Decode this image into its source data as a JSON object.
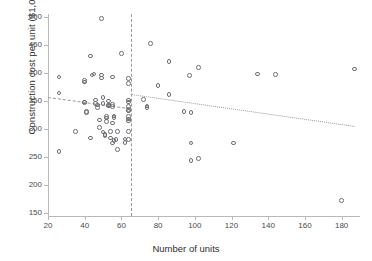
{
  "figure": {
    "title_fragment": "",
    "xlabel": "Number of units",
    "ylabel": "Construction cost per unit ($1,000s)"
  },
  "chart_data": {
    "type": "scatter",
    "title": "",
    "xlabel": "Number of units",
    "ylabel": "Construction cost per unit ($1,000s)",
    "xlim": [
      20,
      190
    ],
    "ylim": [
      145,
      505
    ],
    "xticks": [
      20,
      40,
      60,
      80,
      100,
      120,
      140,
      160,
      180
    ],
    "yticks": [
      150,
      200,
      250,
      300,
      350,
      400,
      450,
      500
    ],
    "grid": false,
    "legend": "none",
    "marker": "open-circle",
    "annotations": [
      {
        "name": "threshold-line",
        "type": "vline",
        "x": 65,
        "style": "dashed"
      },
      {
        "name": "trend-left",
        "type": "segment",
        "x0": 20,
        "y0": 357,
        "x1": 65,
        "y1": 337,
        "style": "dashed"
      },
      {
        "name": "trend-right",
        "type": "segment",
        "x0": 65,
        "y0": 362,
        "x1": 187,
        "y1": 305,
        "style": "dotted"
      }
    ],
    "points": [
      [
        26,
        393
      ],
      [
        26,
        364
      ],
      [
        26,
        260
      ],
      [
        35,
        296
      ],
      [
        40,
        386
      ],
      [
        40,
        384
      ],
      [
        40,
        348
      ],
      [
        40,
        347
      ],
      [
        41,
        331
      ],
      [
        41,
        329
      ],
      [
        43,
        430
      ],
      [
        43,
        284
      ],
      [
        44,
        396
      ],
      [
        45,
        398
      ],
      [
        46,
        352
      ],
      [
        46,
        346
      ],
      [
        47,
        343
      ],
      [
        47,
        338
      ],
      [
        48,
        316
      ],
      [
        48,
        303
      ],
      [
        49,
        497
      ],
      [
        49,
        391
      ],
      [
        49,
        396
      ],
      [
        50,
        356
      ],
      [
        50,
        345
      ],
      [
        50,
        295
      ],
      [
        51,
        290
      ],
      [
        51,
        288
      ],
      [
        52,
        322
      ],
      [
        52,
        320
      ],
      [
        52,
        313
      ],
      [
        53,
        350
      ],
      [
        53,
        343
      ],
      [
        53,
        341
      ],
      [
        54,
        296
      ],
      [
        54,
        284
      ],
      [
        55,
        393
      ],
      [
        55,
        344
      ],
      [
        55,
        340
      ],
      [
        55,
        311
      ],
      [
        55,
        275
      ],
      [
        56,
        323
      ],
      [
        56,
        321
      ],
      [
        56,
        280
      ],
      [
        57,
        281
      ],
      [
        58,
        296
      ],
      [
        58,
        263
      ],
      [
        60,
        435
      ],
      [
        62,
        282
      ],
      [
        62,
        276
      ],
      [
        64,
        390
      ],
      [
        64,
        381
      ],
      [
        64,
        352
      ],
      [
        64,
        348
      ],
      [
        64,
        340
      ],
      [
        64,
        335
      ],
      [
        64,
        332
      ],
      [
        64,
        322
      ],
      [
        64,
        318
      ],
      [
        64,
        314
      ],
      [
        64,
        296
      ],
      [
        64,
        281
      ],
      [
        72,
        353
      ],
      [
        74,
        341
      ],
      [
        74,
        338
      ],
      [
        76,
        452
      ],
      [
        80,
        378
      ],
      [
        86,
        420
      ],
      [
        86,
        362
      ],
      [
        94,
        331
      ],
      [
        97,
        395
      ],
      [
        98,
        329
      ],
      [
        98,
        275
      ],
      [
        98,
        244
      ],
      [
        102,
        410
      ],
      [
        102,
        247
      ],
      [
        121,
        275
      ],
      [
        134,
        398
      ],
      [
        144,
        397
      ],
      [
        180,
        173
      ],
      [
        187,
        407
      ]
    ]
  }
}
